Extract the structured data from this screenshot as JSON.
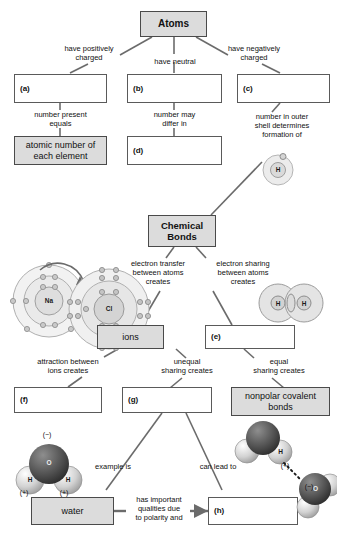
{
  "diagram": {
    "colors": {
      "shaded_box_fill": "#dcdcdc",
      "box_border": "#5a5a5a",
      "connector_line": "#6b6b6b",
      "text": "#111111",
      "oxygen_sphere": "#4a4a4a",
      "hydrogen_sphere": "#d9d9d9",
      "shell_fill": "#e6e6e6"
    }
  },
  "nodes": {
    "atoms": "Atoms",
    "a": "(a)",
    "b": "(b)",
    "c": "(c)",
    "atomic_number": "atomic number of\neach element",
    "d": "(d)",
    "chemical_bonds": "Chemical\nBonds",
    "ions": "ions",
    "e": "(e)",
    "f": "(f)",
    "g": "(g)",
    "nonpolar": "nonpolar\ncovalent bonds",
    "water": "water",
    "h": "(h)"
  },
  "connectors": {
    "have_positively_charged": "have positively\ncharged",
    "have_neutral": "have neutral",
    "have_negatively_charged": "have negatively\ncharged",
    "number_present_equals": "number present\nequals",
    "number_may_differ_in": "number may\ndiffer in",
    "number_outer_shell": "number in outer\nshell determines\nformation of",
    "electron_transfer": "electron transfer\nbetween atoms\ncreates",
    "electron_sharing": "electron sharing\nbetween atoms\ncreates",
    "attraction_between_ions": "attraction between\nions creates",
    "unequal_sharing": "unequal\nsharing creates",
    "equal_sharing": "equal\nsharing creates",
    "example_is": "example is",
    "can_lead_to": "can lead to",
    "has_important_qualities": "has important\nqualities due\nto polarity and"
  },
  "illustrations": {
    "hydrogen_atom": {
      "nucleus": "H"
    },
    "sodium_atom": {
      "nucleus": "Na"
    },
    "chlorine_atom": {
      "nucleus": "Cl"
    },
    "hydrogen_molecule": {
      "left": "H",
      "right": "H"
    },
    "water_molecule": {
      "oxygen": "O",
      "hydrogen_left": "H",
      "hydrogen_right": "H",
      "oxygen_charge": "(−)",
      "hydrogen_left_charge": "(+)",
      "hydrogen_right_charge": "(+)"
    },
    "hydrogen_bond_pair": {
      "donor_hydrogen": "H",
      "donor_charge": "(+)",
      "acceptor_oxygen": "O",
      "acceptor_charge": "(−)"
    }
  }
}
